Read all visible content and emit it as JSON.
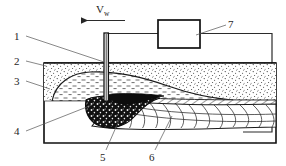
{
  "figure": {
    "type": "technical-diagram",
    "background_color": "#ffffff",
    "line_color": "#262626"
  },
  "annotations": {
    "velocity": {
      "symbol": "V",
      "subscript": "w",
      "arrow_direction": "left"
    },
    "callouts": [
      {
        "id": "1",
        "label": "1",
        "x": 18,
        "y": 38
      },
      {
        "id": "2",
        "label": "2",
        "x": 18,
        "y": 62
      },
      {
        "id": "3",
        "label": "3",
        "x": 18,
        "y": 82
      },
      {
        "id": "4",
        "label": "4",
        "x": 18,
        "y": 133
      },
      {
        "id": "5",
        "label": "5",
        "x": 103,
        "y": 157
      },
      {
        "id": "6",
        "label": "6",
        "x": 152,
        "y": 157
      },
      {
        "id": "7",
        "label": "7",
        "x": 229,
        "y": 27
      }
    ]
  },
  "components": {
    "power_source": {
      "name": "power-source-box"
    },
    "electrode": {
      "name": "electrode-wire"
    },
    "flux_layer": {
      "name": "granular-flux-layer"
    },
    "slag_layer": {
      "name": "solidified-slag-layer"
    },
    "weld_pool": {
      "name": "molten-weld-pool"
    },
    "weld_bead": {
      "name": "solidified-weld-bead"
    },
    "workpiece": {
      "name": "base-metal-workpiece"
    },
    "circuit": {
      "name": "welding-circuit-wiring"
    }
  }
}
